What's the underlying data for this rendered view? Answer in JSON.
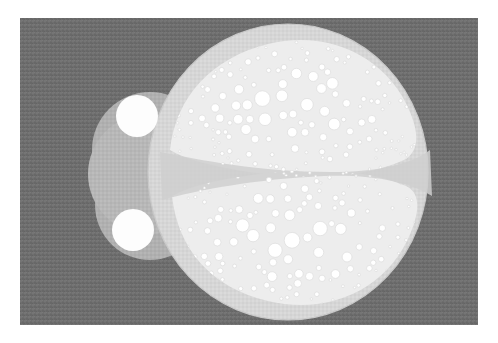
{
  "image": {
    "title": "Bubble-packed bilobed specimen on grey field",
    "kind": "natural-image",
    "width": 498,
    "height": 343
  },
  "canvas": {
    "paper_color": "#ffffff",
    "margin_left": 20,
    "margin_top": 18,
    "plate_x": 20,
    "plate_y": 18,
    "plate_width": 458,
    "plate_height": 307,
    "background_color": "#6e6e6e",
    "background_texture": "woven-speckle"
  },
  "palette": {
    "background": "#6e6e6e",
    "head_grey": "#b7b7b7",
    "body_grey": "#d6d6d6",
    "body_rim": "#c9c9c9",
    "lobe_field": "#ededed",
    "divider_band": "#cfcfcf",
    "bubble_fill": "#ffffff",
    "bubble_stroke": "#dcdcdc",
    "eye_fill": "#fdfdfd",
    "paper": "#ffffff"
  },
  "parts": [
    {
      "name": "head",
      "label": "Head lobe",
      "shape": "circle",
      "cx": 148,
      "cy": 174,
      "r": 60,
      "color": "#b7b7b7"
    },
    {
      "name": "body",
      "label": "Body shield",
      "shape": "ellipse",
      "cx": 288,
      "cy": 172,
      "rx": 140,
      "ry": 148,
      "color": "#d6d6d6"
    },
    {
      "name": "eye-top",
      "label": "Upper eye",
      "shape": "circle",
      "cx": 137,
      "cy": 116,
      "r": 21,
      "color": "#fdfdfd"
    },
    {
      "name": "eye-bottom",
      "label": "Lower eye",
      "shape": "circle",
      "cx": 133,
      "cy": 230,
      "r": 21,
      "color": "#fdfdfd"
    },
    {
      "name": "lobe-upper",
      "label": "Upper bubble lobe",
      "bubble_count": 236
    },
    {
      "name": "lobe-lower",
      "label": "Lower bubble lobe",
      "bubble_count": 232
    },
    {
      "name": "divider",
      "label": "Median divider band",
      "color": "#cfcfcf"
    }
  ],
  "bubbles": {
    "fill": "#ffffff",
    "stroke": "#dcdcdc",
    "min_radius": 1.2,
    "max_radius": 10.5,
    "total_count": 468,
    "packing": "random-size-graded",
    "note": "Large bubbles toward lobe centre, fine bubbles along lobe margins"
  }
}
